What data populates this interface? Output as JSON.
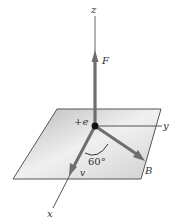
{
  "diagram": {
    "labels": {
      "z_axis": "z",
      "y_axis": "y",
      "x_axis": "x",
      "force": "F",
      "charge": "+e",
      "field": "B",
      "velocity": "v",
      "angle": "60°"
    },
    "colors": {
      "plane_fill_light": "#f2f2f2",
      "plane_fill_dark": "#bdbdbd",
      "plane_edge": "#555555",
      "vector": "#6e6e6e",
      "axis": "#555555",
      "charge_dot": "#111111"
    }
  }
}
